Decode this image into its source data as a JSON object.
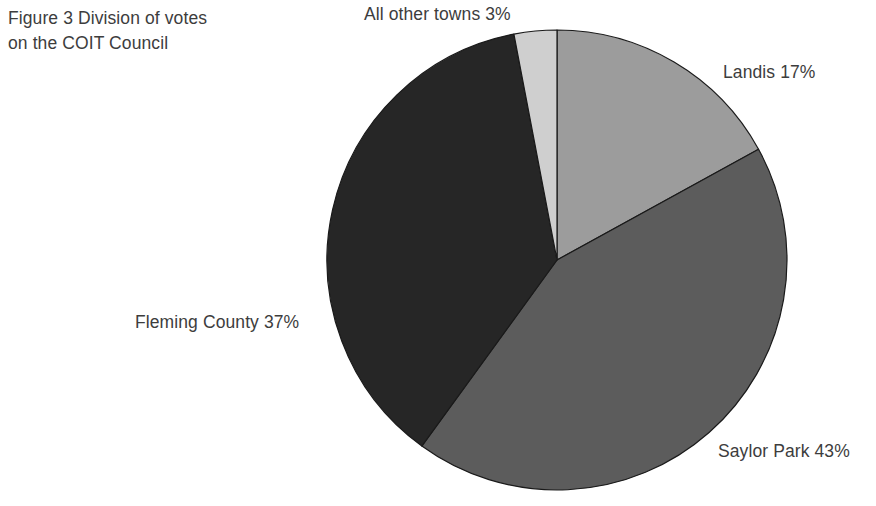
{
  "figure": {
    "title": "Figure 3   Division of votes\non the COIT Council"
  },
  "labels": {
    "all_other_towns": "All other towns 3%",
    "landis": "Landis 17%",
    "saylor_park": "Saylor Park 43%",
    "fleming_county": "Fleming County 37%"
  },
  "chart_data": {
    "type": "pie",
    "title": "Figure 3   Division of votes on the COIT Council",
    "xlabel": "",
    "ylabel": "",
    "legend_position": "none",
    "grid": false,
    "start_angle_deg": 0,
    "direction": "clockwise",
    "center": {
      "x": 557,
      "y": 260
    },
    "radius": 230,
    "categories": [
      "Landis",
      "Saylor Park",
      "Fleming County",
      "All other towns"
    ],
    "values": [
      17,
      43,
      37,
      3
    ],
    "unit": "%",
    "colors": [
      "#9c9c9c",
      "#5c5c5c",
      "#262626",
      "#cfcfcf"
    ],
    "slice_border_color": "#1a1a1a",
    "annotations": [
      {
        "text": "Landis 17%",
        "value": 17,
        "position": "right"
      },
      {
        "text": "Saylor Park 43%",
        "value": 43,
        "position": "bottom-right"
      },
      {
        "text": "Fleming County 37%",
        "value": 37,
        "position": "left"
      },
      {
        "text": "All other towns 3%",
        "value": 3,
        "position": "top"
      }
    ]
  }
}
